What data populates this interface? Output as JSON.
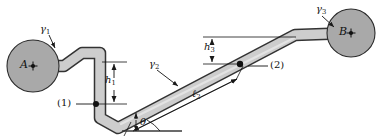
{
  "figure": {
    "type": "engineering-diagram",
    "width": 390,
    "height": 140,
    "background": "#ffffff"
  },
  "colors": {
    "tank_fill": "#a9a9a9",
    "pipe_fill": "#cfcfcf",
    "pipe_fill_light": "#dcdcdc",
    "outline": "#2b2b2b",
    "label": "#111111",
    "ground": "#3a3a3a"
  },
  "tanks": [
    {
      "id": "tank-a",
      "label": "A",
      "center_x": 33,
      "center_y": 66,
      "radius": 26,
      "fill": "#a9a9a9",
      "specific_weight_label": "γ",
      "specific_weight_sub": "1"
    },
    {
      "id": "tank-b",
      "label": "B",
      "center_x": 351,
      "center_y": 33,
      "radius": 24,
      "fill": "#a9a9a9",
      "specific_weight_label": "γ",
      "specific_weight_sub": "3"
    }
  ],
  "fluid_labels": [
    {
      "id": "gamma-1",
      "symbol": "γ",
      "sub": "1",
      "x": 42,
      "y": 26,
      "points_to": "tank-a"
    },
    {
      "id": "gamma-2",
      "symbol": "γ",
      "sub": "2",
      "x": 151,
      "y": 61,
      "points_to": "inclined-pipe"
    },
    {
      "id": "gamma-3",
      "symbol": "γ",
      "sub": "3",
      "x": 318,
      "y": 6,
      "points_to": "tank-b"
    }
  ],
  "station_labels": [
    {
      "id": "station-1",
      "text": "(1)",
      "x": 61,
      "y": 101,
      "dot_x": 96,
      "dot_y": 104
    },
    {
      "id": "station-2",
      "text": "(2)",
      "x": 272,
      "y": 66,
      "dot_x": 240,
      "dot_y": 64
    }
  ],
  "dimensions": [
    {
      "id": "h1",
      "symbol": "h",
      "sub": "1",
      "x": 107,
      "y": 80,
      "type": "vertical",
      "from_y": 62,
      "to_y": 104,
      "at_x": 114
    },
    {
      "id": "h3",
      "symbol": "h",
      "sub": "3",
      "x": 216,
      "y": 46,
      "type": "vertical",
      "from_y": 37,
      "to_y": 64,
      "at_x": 212
    },
    {
      "id": "l2",
      "symbol": "ℓ",
      "sub": "2",
      "x": 196,
      "y": 93,
      "type": "along-incline"
    },
    {
      "id": "theta",
      "symbol": "θ",
      "sub": "",
      "x": 139,
      "y": 120,
      "type": "angle"
    }
  ],
  "geometry": {
    "pipe_width": 9,
    "incline_angle_deg": 20,
    "description": "Pipe leaves tank A horizontally, steps down, drops vertically through h1 to station (1), turns onto an incline of length l2 at angle theta, passes station (2) at height h3, then bends horizontal into tank B."
  }
}
